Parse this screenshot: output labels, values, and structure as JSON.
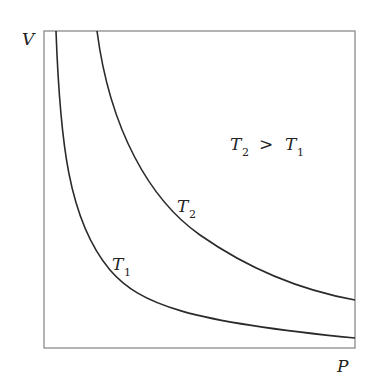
{
  "diagram": {
    "axes": {
      "y_label": "V",
      "x_label": "P"
    },
    "curves": [
      {
        "name": "T1",
        "label_main": "T",
        "label_sub": "1",
        "color": "#2a2a2a"
      },
      {
        "name": "T2",
        "label_main": "T",
        "label_sub": "2",
        "color": "#2a2a2a"
      }
    ],
    "annotation": {
      "left_main": "T",
      "left_sub": "2",
      "relation": ">",
      "right_main": "T",
      "right_sub": "1"
    },
    "frame_color": "#888888"
  }
}
